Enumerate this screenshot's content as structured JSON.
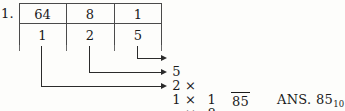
{
  "problem": {
    "number_label": "1."
  },
  "place_value_table": {
    "weights_row": [
      "64",
      "8",
      "1"
    ],
    "digits_row": [
      "1",
      "2",
      "5"
    ]
  },
  "equations": [
    {
      "digit": "5",
      "times": "×",
      "weight": "1",
      "equals": "=",
      "product": "5"
    },
    {
      "digit": "2",
      "times": "×",
      "weight": "8",
      "equals": "=",
      "product": "16"
    },
    {
      "digit": "1",
      "times": "×",
      "weight": "64",
      "equals": "=",
      "product": "64"
    }
  ],
  "sum": {
    "total": "85"
  },
  "answer": {
    "prefix": "ANS.",
    "value": "85",
    "subscript": "10"
  },
  "colors": {
    "ink": "#1a1a1a",
    "rule": "#4a4a4a",
    "connector": "#2b2b2b",
    "paper": "#fdfdfb"
  }
}
